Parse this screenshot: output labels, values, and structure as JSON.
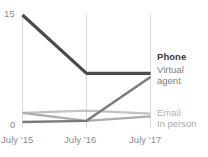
{
  "chart_data": {
    "type": "line",
    "title": "",
    "subtitle": "",
    "xlabel": "",
    "ylabel": "",
    "x": [
      "July '15",
      "July '16",
      "July '17"
    ],
    "categories": [
      "July '15",
      "July '16",
      "July '17"
    ],
    "ylim": [
      0,
      15
    ],
    "xlim": [
      0,
      2
    ],
    "grid": "vertical-only",
    "legend_position": "right-inline-end-of-line",
    "y_ticks": [
      "0",
      "15"
    ],
    "y_tick_values": [
      0,
      15
    ],
    "x_tick_labels": [
      "July '15",
      "July '16",
      "July '17"
    ],
    "series": [
      {
        "name": "Phone",
        "values": [
          15,
          7,
          7
        ],
        "color": "#4a4a4a",
        "width": 3.2,
        "emphasis": "bold"
      },
      {
        "name": "Virtual agent",
        "values": [
          0.35,
          0.5,
          6.5
        ],
        "color": "#7a7a7a",
        "width": 2.4,
        "emphasis": "normal"
      },
      {
        "name": "Email",
        "values": [
          1.6,
          1.9,
          1.5
        ],
        "color": "#c2c2c2",
        "width": 2.2,
        "emphasis": "muted"
      },
      {
        "name": "In person",
        "values": [
          1.6,
          0.5,
          1.1
        ],
        "color": "#acacac",
        "width": 2.2,
        "emphasis": "muted"
      }
    ]
  },
  "axes": {
    "y_max_label": "15",
    "y_min_label": "0",
    "x_labels": [
      "July '15",
      "July '16",
      "July '17"
    ]
  },
  "legend": {
    "items": [
      {
        "label": "Phone"
      },
      {
        "label": "Virtual agent"
      },
      {
        "label": "Email"
      },
      {
        "label": "In person"
      }
    ]
  },
  "colors": {
    "background": "#ffffff",
    "gridline": "#dcdcdc",
    "tick_text": "#8c8c8c",
    "phone": "#4a4a4a",
    "virtual_agent": "#7a7a7a",
    "email": "#c2c2c2",
    "in_person": "#acacac"
  }
}
